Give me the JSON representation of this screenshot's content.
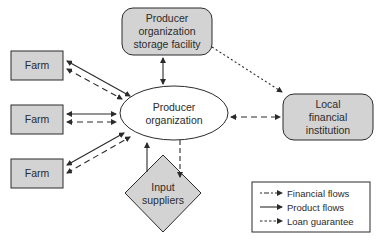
{
  "nodes": {
    "storage": {
      "line1": "Producer",
      "line2": "organization",
      "line3": "storage facility"
    },
    "local_fi": {
      "line1": "Local",
      "line2": "financial",
      "line3": "institution"
    },
    "producer_org": {
      "line1": "Producer",
      "line2": "organization"
    },
    "input_suppliers": {
      "line1": "Input",
      "line2": "suppliers"
    },
    "farms": [
      {
        "label": "Farm"
      },
      {
        "label": "Farm"
      },
      {
        "label": "Farm"
      }
    ]
  },
  "legend": {
    "items": [
      {
        "label": "Financial flows",
        "style": "dash-dot"
      },
      {
        "label": "Product flows",
        "style": "solid"
      },
      {
        "label": "Loan guarantee",
        "style": "dotted"
      }
    ]
  },
  "colors": {
    "node_fill": "#d3d3d3",
    "stroke": "#2b2b2b",
    "background": "#ffffff"
  }
}
